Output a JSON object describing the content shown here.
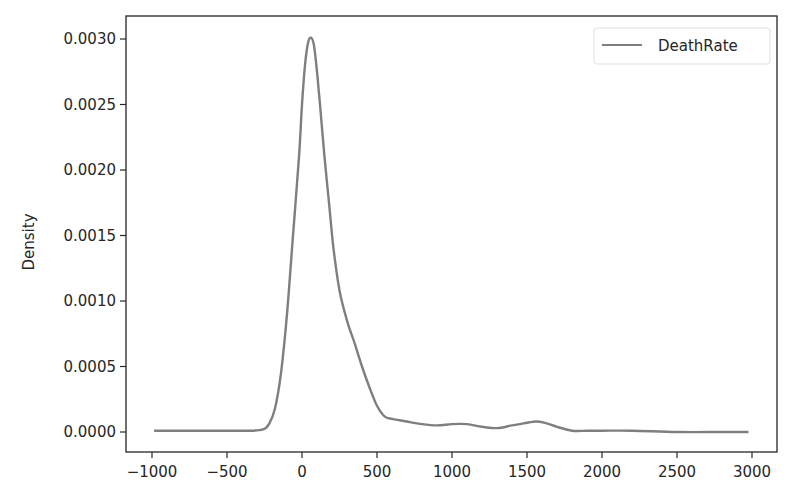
{
  "chart_data": {
    "type": "line",
    "subtype": "kde",
    "title": "",
    "xlabel": "",
    "ylabel": "Density",
    "xlim": [
      -1200,
      3150
    ],
    "ylim": [
      -0.00015,
      0.00318
    ],
    "grid": false,
    "legend_position": "upper right",
    "x_ticks": [
      -1000,
      -500,
      0,
      500,
      1000,
      1500,
      2000,
      2500,
      3000
    ],
    "x_tick_labels": [
      "−1000",
      "−500",
      "0",
      "500",
      "1000",
      "1500",
      "2000",
      "2500",
      "3000"
    ],
    "y_ticks": [
      0.0,
      0.0005,
      0.001,
      0.0015,
      0.002,
      0.0025,
      0.003
    ],
    "y_tick_labels": [
      "0.0000",
      "0.0005",
      "0.0010",
      "0.0015",
      "0.0020",
      "0.0025",
      "0.0030"
    ],
    "series": [
      {
        "name": "DeathRate",
        "color": "#7f7f7f",
        "x": [
          -980,
          -600,
          -350,
          -260,
          -220,
          -180,
          -140,
          -100,
          -60,
          -20,
          0,
          20,
          40,
          60,
          80,
          100,
          120,
          150,
          180,
          210,
          250,
          300,
          350,
          400,
          450,
          500,
          550,
          600,
          650,
          700,
          800,
          900,
          1000,
          1100,
          1200,
          1300,
          1400,
          1500,
          1560,
          1620,
          1700,
          1800,
          1900,
          2000,
          2200,
          2500,
          2800,
          2970
        ],
        "y": [
          1e-05,
          1e-05,
          1e-05,
          2e-05,
          6e-05,
          0.00018,
          0.00045,
          0.0009,
          0.0015,
          0.0021,
          0.0025,
          0.0028,
          0.00297,
          0.00301,
          0.00295,
          0.00275,
          0.0025,
          0.0021,
          0.00175,
          0.0014,
          0.00108,
          0.00085,
          0.00068,
          0.0005,
          0.00034,
          0.0002,
          0.00012,
          0.0001,
          9e-05,
          8e-05,
          6e-05,
          5e-05,
          6e-05,
          6e-05,
          4e-05,
          3e-05,
          5e-05,
          7e-05,
          8e-05,
          7e-05,
          4e-05,
          1e-05,
          1e-05,
          1e-05,
          1e-05,
          0.0,
          0.0,
          0.0
        ]
      }
    ]
  },
  "legend": {
    "items": [
      {
        "label": "DeathRate",
        "color": "#7f7f7f"
      }
    ]
  },
  "axes": {
    "ylabel": "Density"
  }
}
